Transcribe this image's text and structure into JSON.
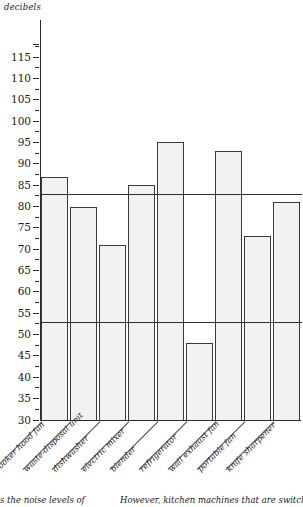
{
  "axis": {
    "unit_caption": "decibels",
    "tick_labels": [
      "115",
      "110",
      "105",
      "100",
      "95",
      "90",
      "85",
      "80",
      "75",
      "70",
      "65",
      "60",
      "55",
      "50",
      "45",
      "40",
      "35",
      "30"
    ]
  },
  "footer": {
    "left_fragment": "s the noise levels of",
    "right_fragment": "However, kitchen machines that are switched on"
  },
  "colors": {
    "bar_fill": "#f2f2f0",
    "bar_stroke": "#3a3a3a",
    "axis": "#2b2b2b",
    "reference_line": "#2f2f2f",
    "text": "#1a1a1a"
  },
  "chart_data": {
    "type": "bar",
    "title": "",
    "subtitle": "",
    "xlabel": "",
    "ylabel": "decibels",
    "ylim": [
      30,
      118
    ],
    "ytick_step": 5,
    "yticks": [
      30,
      35,
      40,
      45,
      50,
      55,
      60,
      65,
      70,
      75,
      80,
      85,
      90,
      95,
      100,
      105,
      110,
      115
    ],
    "grid": false,
    "legend": "none",
    "categories": [
      "cooker hood fan",
      "waste-disposal unit",
      "dishwasher",
      "electric mixer",
      "blender",
      "refrigerator",
      "wall exhaust fan",
      "portable fan",
      "knife sharpener"
    ],
    "values": [
      87,
      80,
      71,
      85,
      95,
      48,
      93,
      73,
      81
    ],
    "reference_lines": [
      {
        "value": 83,
        "label": ""
      },
      {
        "value": 53,
        "label": ""
      }
    ],
    "annotations": []
  }
}
